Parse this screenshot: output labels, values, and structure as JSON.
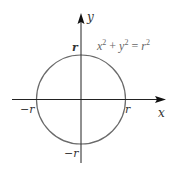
{
  "diagram": {
    "type": "circle-on-axes",
    "equation": {
      "x": "x",
      "x_exp": "2",
      "plus": " + ",
      "y": "y",
      "y_exp": "2",
      "equals": " = ",
      "r": "r",
      "r_exp": "2"
    },
    "axes": {
      "x_label": "x",
      "y_label": "y"
    },
    "intercepts": {
      "top": "r",
      "bottom": "−r",
      "left": "−r",
      "right": "r"
    },
    "colors": {
      "axis": "#222222",
      "circle": "#6a6a6a",
      "label": "#333333",
      "equation": "#666666"
    }
  }
}
